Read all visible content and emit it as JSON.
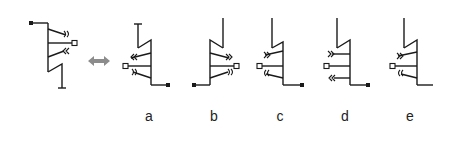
{
  "diagram": {
    "reference": {
      "name": "reference-symbol"
    },
    "relation_arrow": {
      "name": "double-headed-arrow",
      "color": "#8c8c8c"
    },
    "options": [
      {
        "id": "a",
        "label": "a"
      },
      {
        "id": "b",
        "label": "b"
      },
      {
        "id": "c",
        "label": "c"
      },
      {
        "id": "d",
        "label": "d"
      },
      {
        "id": "e",
        "label": "e"
      }
    ]
  },
  "colors": {
    "line": "#1a1a1a",
    "arrow": "#8c8c8c",
    "background": "#ffffff"
  }
}
